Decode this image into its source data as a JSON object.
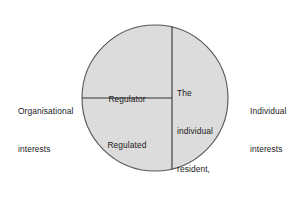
{
  "diagram": {
    "type": "circle-quadrant-diagram",
    "shape": {
      "circle": {
        "center_x": 155,
        "center_y": 98,
        "radius": 73,
        "fill_color": "#dcdcdc",
        "stroke_color": "#555555"
      },
      "vertical_divider": {
        "x": 172,
        "from_y": 25,
        "to_y": 184,
        "stroke_color": "#333333"
      },
      "horizontal_divider": {
        "y": 98,
        "from_x": 82,
        "to_x": 172,
        "stroke_color": "#333333"
      }
    },
    "left_label": {
      "line1": "Organisational",
      "line2": "interests"
    },
    "right_label": {
      "line1": "Individual",
      "line2": "interests"
    },
    "upper_left_segment": {
      "label": "Regulator"
    },
    "lower_left_segment": {
      "label": "Regulated"
    },
    "right_segment": {
      "line1": "The",
      "line2": "individual",
      "line3": "resident,",
      "line4": "patient,",
      "line5": "client"
    }
  }
}
